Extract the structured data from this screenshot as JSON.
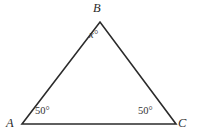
{
  "figure": {
    "type": "geometry-diagram",
    "shape": "triangle",
    "background_color": "#ffffff",
    "stroke_color": "#2b2b2b",
    "stroke_width": 1.6,
    "vertices": [
      {
        "name": "A",
        "label": "A",
        "x": 22,
        "y": 124
      },
      {
        "name": "B",
        "label": "B",
        "x": 100,
        "y": 22
      },
      {
        "name": "C",
        "label": "C",
        "x": 176,
        "y": 124
      }
    ],
    "angle_labels": [
      {
        "at": "A",
        "text": "50°"
      },
      {
        "at": "B",
        "text": "x°"
      },
      {
        "at": "C",
        "text": "50°"
      }
    ]
  },
  "chart_data": {
    "type": "diagram",
    "title": "",
    "shape": "triangle",
    "points": [
      {
        "label": "A",
        "x": 22,
        "y": 124
      },
      {
        "label": "B",
        "x": 100,
        "y": 22
      },
      {
        "label": "C",
        "x": 176,
        "y": 124
      }
    ],
    "annotations": [
      {
        "label": "50°",
        "vertex": "A"
      },
      {
        "label": "x°",
        "vertex": "B"
      },
      {
        "label": "50°",
        "vertex": "C"
      }
    ]
  }
}
